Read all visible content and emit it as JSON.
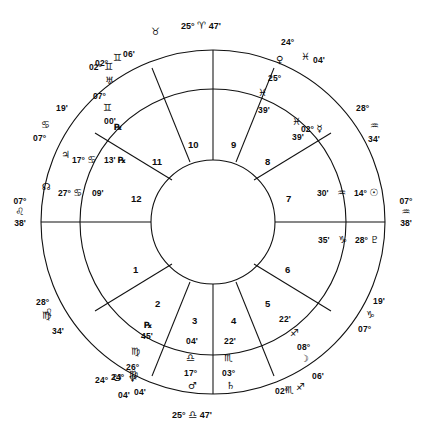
{
  "chart": {
    "type": "astrological-natal-wheel",
    "axis_points": [
      {
        "name": "midheaven",
        "degree": "25°",
        "sign_glyph": "♈",
        "sign": "Aries",
        "minute": "47'",
        "position": "top"
      },
      {
        "name": "ascendant",
        "degree": "07°",
        "sign_glyph": "♌",
        "sign": "Leo",
        "minute": "38'",
        "position": "left"
      },
      {
        "name": "descendant",
        "degree": "07°",
        "sign_glyph": "♒",
        "sign": "Aquarius",
        "minute": "38'",
        "position": "right"
      },
      {
        "name": "imum-coeli",
        "degree": "25°",
        "sign_glyph": "♎",
        "sign": "Libra",
        "minute": "47'",
        "position": "bottom"
      }
    ],
    "outer_sign_ticks": [
      {
        "glyph": "♉",
        "sign": "Taurus",
        "x": 152,
        "y": 31
      },
      {
        "glyph": "♌",
        "sign": "Leo",
        "x": 46,
        "y": 313
      }
    ],
    "house_numbers": [
      "1",
      "2",
      "3",
      "4",
      "5",
      "6",
      "7",
      "8",
      "9",
      "10",
      "11",
      "12"
    ],
    "house_cusps": [
      {
        "house": 12,
        "degree": "07°",
        "sign_glyph": "♋",
        "sign": "Cancer",
        "minute": "19'"
      },
      {
        "house": 11,
        "degree": "02°",
        "sign_glyph": "♊",
        "sign": "Gemini",
        "minute": "06'"
      },
      {
        "house": 9,
        "degree": "24°",
        "sign_glyph": "♓",
        "sign": "Pisces",
        "minute": "04'"
      },
      {
        "house": 8,
        "degree": "28°",
        "sign_glyph": "♒",
        "sign": "Aquarius",
        "minute": "34'"
      },
      {
        "house": 6,
        "degree": "07°",
        "sign_glyph": "♑",
        "sign": "Capricorn",
        "minute": "19'"
      },
      {
        "house": 5,
        "degree": "02°",
        "sign_glyph": "♐",
        "sign": "Sagittarius",
        "minute": "06'"
      },
      {
        "house": 3,
        "degree": "24°",
        "sign_glyph": "♍",
        "sign": "Virgo",
        "minute": "04'"
      },
      {
        "house": 2,
        "degree": "28°",
        "sign_glyph": "♍",
        "sign": "Virgo",
        "minute": "34'"
      }
    ],
    "planets": [
      {
        "name": "uranus",
        "glyph": "♅",
        "degree": "02°",
        "sign_glyph": "♊",
        "sign": "Gemini",
        "minute": "06'",
        "retrograde": false
      },
      {
        "name": "pluto-node",
        "glyph": "♇",
        "degree": "07°",
        "sign_glyph": "♊",
        "sign": "Gemini",
        "minute": "00'",
        "retrograde": true
      },
      {
        "name": "jupiter",
        "glyph": "♃",
        "degree": "17°",
        "sign_glyph": "♋",
        "sign": "Cancer",
        "minute": "13'",
        "retrograde": true
      },
      {
        "name": "north-node",
        "glyph": "☊",
        "degree": "27°",
        "sign_glyph": "♋",
        "sign": "Cancer",
        "minute": "09'",
        "retrograde": false
      },
      {
        "name": "venus",
        "glyph": "♀",
        "degree": "25°",
        "sign_glyph": "♓",
        "sign": "Pisces",
        "minute": "39'",
        "retrograde": false
      },
      {
        "name": "mercury",
        "glyph": "☿",
        "degree": "02°",
        "sign_glyph": "♓",
        "sign": "Pisces",
        "minute": "39'",
        "retrograde": false
      },
      {
        "name": "sun",
        "glyph": "☉",
        "degree": "14°",
        "sign_glyph": "♒",
        "sign": "Aquarius",
        "minute": "30'",
        "retrograde": false
      },
      {
        "name": "pluto",
        "glyph": "♇",
        "degree": "28°",
        "sign_glyph": "♑",
        "sign": "Capricorn",
        "minute": "35'",
        "retrograde": false
      },
      {
        "name": "moon",
        "glyph": "☽",
        "degree": "08°",
        "sign_glyph": "♐",
        "sign": "Sagittarius",
        "minute": "22'",
        "retrograde": false
      },
      {
        "name": "saturn",
        "glyph": "♄",
        "degree": "03°",
        "sign_glyph": "♏",
        "sign": "Scorpio",
        "minute": "22'",
        "retrograde": false
      },
      {
        "name": "mars",
        "glyph": "♂",
        "degree": "17°",
        "sign_glyph": "♎",
        "sign": "Libra",
        "minute": "04'",
        "retrograde": false
      },
      {
        "name": "neptune",
        "glyph": "♆",
        "degree": "26°",
        "sign_glyph": "♍",
        "sign": "Virgo",
        "minute": "45'",
        "retrograde": true
      },
      {
        "name": "south-node",
        "glyph": "☋",
        "degree": "24°",
        "sign_glyph": "♏",
        "sign": "Scorpio",
        "minute": "04'",
        "retrograde": false
      }
    ],
    "labels": {
      "mc_deg": "25°",
      "mc_sign": "♈",
      "mc_min": "47'",
      "ic_deg": "25°",
      "ic_sign": "♎",
      "ic_min": "47'",
      "asc_deg": "07°",
      "asc_sign": "♌",
      "asc_min": "38'",
      "dsc_deg": "07°",
      "dsc_sign": "♒",
      "dsc_min": "38'",
      "c12_deg": "07°",
      "c12_sign": "♋",
      "c12_min": "19'",
      "c11_deg": "02°",
      "c11_sign": "♊",
      "c11_min": "06'",
      "c9_deg": "24°",
      "c9_sign": "♓",
      "c9_min": "04'",
      "c8_deg": "28°",
      "c8_sign": "♒",
      "c8_min": "34'",
      "c6_deg": "07°",
      "c6_sign": "♑",
      "c6_min": "19'",
      "c5_deg": "02°",
      "c5_sign": "♐",
      "c5_min": "06'",
      "c3_deg": "24°",
      "c3_sign": "♍",
      "c3_min": "04'",
      "c2_deg": "28°",
      "c2_sign": "♍",
      "c2_min": "34'",
      "h1": "1",
      "h2": "2",
      "h3": "3",
      "h4": "4",
      "h5": "5",
      "h6": "6",
      "h7": "7",
      "h8": "8",
      "h9": "9",
      "h10": "10",
      "h11": "11",
      "h12": "12",
      "tick_taurus": "♉",
      "tick_leo": "♌",
      "p_uranus_deg": "02°",
      "p_uranus_sign": "♊",
      "p_uranus_min": "06'",
      "p_uranus_glyph": "♅",
      "p_plutonode_deg": "07°",
      "p_plutonode_sign": "♊",
      "p_plutonode_min": "00'",
      "p_plutonode_glyph": "♇",
      "p_jupiter_deg": "17°",
      "p_jupiter_sign": "♋",
      "p_jupiter_min": "13'",
      "p_jupiter_glyph": "♃",
      "p_jupiter_r": "℞",
      "p_node_deg": "27°",
      "p_node_sign": "♋",
      "p_node_min": "09'",
      "p_node_glyph": "☊",
      "p_venus_deg": "25°",
      "p_venus_sign": "♓",
      "p_venus_min": "39'",
      "p_venus_glyph": "♀",
      "p_mercury_deg": "02°",
      "p_mercury_sign": "♓",
      "p_mercury_min": "39'",
      "p_mercury_glyph": "☿",
      "p_sun_deg": "14°",
      "p_sun_sign": "♒",
      "p_sun_min": "30'",
      "p_sun_glyph": "☉",
      "p_pluto_deg": "28°",
      "p_pluto_sign": "♑",
      "p_pluto_min": "35'",
      "p_pluto_glyph": "♇",
      "p_moon_deg": "08°",
      "p_moon_sign": "♐",
      "p_moon_min": "22'",
      "p_moon_glyph": "☽",
      "p_saturn_deg": "03°",
      "p_saturn_sign": "♏",
      "p_saturn_min": "22'",
      "p_saturn_glyph": "♄",
      "p_mars_deg": "17°",
      "p_mars_sign": "♎",
      "p_mars_min": "04'",
      "p_mars_glyph": "♂",
      "p_neptune_deg": "26°",
      "p_neptune_sign": "♍",
      "p_neptune_min": "45'",
      "p_neptune_glyph": "♆",
      "p_neptune_r": "℞",
      "p_snode_deg": "24°",
      "p_snode_sign": "♏",
      "p_snode_min": "04'",
      "p_snode_glyph": "☋"
    },
    "colors": {
      "line": "#111111",
      "background": "#ffffff",
      "text": "#0d0d0d"
    }
  }
}
